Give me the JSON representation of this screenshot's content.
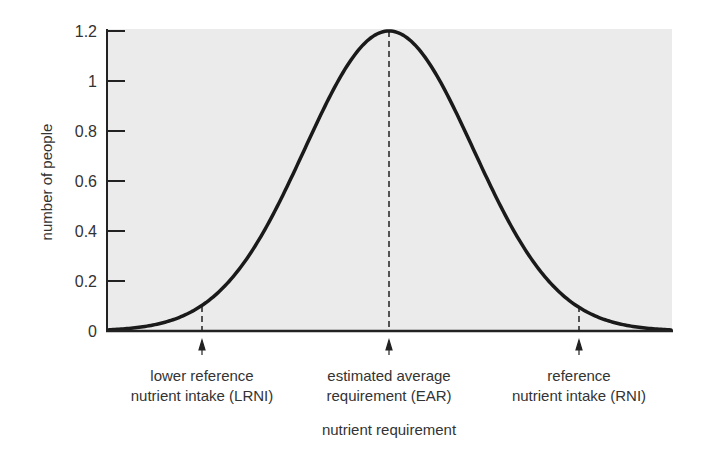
{
  "chart_data": {
    "type": "line",
    "title": "",
    "xlabel": "nutrient requirement",
    "ylabel": "number of people",
    "ylim": [
      0,
      1.2
    ],
    "yticks": [
      0,
      0.2,
      0.4,
      0.6,
      0.8,
      1,
      1.2
    ],
    "ytick_labels": [
      "0",
      "0.2",
      "0.4",
      "0.6",
      "0.8",
      "1",
      "1.2"
    ],
    "grid": false,
    "legend": null,
    "background": "#ebebeb",
    "series": [
      {
        "name": "distribution of requirements",
        "shape": "normal (bell) curve",
        "peak": 1.2,
        "x_relative_sd": [
          -3.4,
          -3,
          -2.5,
          -2.229,
          -2,
          -1.5,
          -1,
          -0.5,
          0,
          0.5,
          1,
          1.5,
          2,
          2.229,
          2.5,
          3,
          3.4
        ],
        "values": [
          0.004,
          0.013,
          0.053,
          0.1,
          0.162,
          0.39,
          0.728,
          1.059,
          1.2,
          1.059,
          0.728,
          0.39,
          0.162,
          0.1,
          0.053,
          0.013,
          0.004
        ]
      }
    ],
    "annotations": [
      {
        "id": "lrni",
        "lines": [
          "lower reference",
          "nutrient intake (LRNI)"
        ],
        "x_relative_sd": -2.229,
        "curve_value": 0.1,
        "style": "dashed vertical line + upward arrow"
      },
      {
        "id": "ear",
        "lines": [
          "estimated average",
          "requirement (EAR)"
        ],
        "x_relative_sd": 0,
        "curve_value": 1.2,
        "style": "dashed vertical line + upward arrow"
      },
      {
        "id": "rni",
        "lines": [
          "reference",
          "nutrient intake (RNI)"
        ],
        "x_relative_sd": 2.229,
        "curve_value": 0.1,
        "style": "dashed vertical line + upward arrow"
      }
    ]
  },
  "labels": {
    "ylabel": "number of people",
    "xlabel": "nutrient requirement",
    "yticks": [
      "0",
      "0.2",
      "0.4",
      "0.6",
      "0.8",
      "1",
      "1.2"
    ],
    "lrni_1": "lower reference",
    "lrni_2": "nutrient intake (LRNI)",
    "ear_1": "estimated average",
    "ear_2": "requirement (EAR)",
    "rni_1": "reference",
    "rni_2": "nutrient intake (RNI)"
  }
}
